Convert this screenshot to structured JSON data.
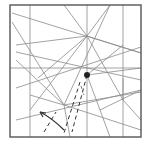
{
  "diagram": {
    "type": "origami-crease-pattern",
    "frame": {
      "x": 10,
      "y": 5,
      "width": 131,
      "height": 132,
      "color": "#555555"
    },
    "crease_color": "#8a8a8a",
    "creases": [
      [
        30,
        5,
        30,
        137
      ],
      [
        123,
        5,
        123,
        137
      ],
      [
        87,
        5,
        87,
        137
      ],
      [
        10,
        68,
        141,
        68
      ],
      [
        12,
        13,
        141,
        53
      ],
      [
        12,
        22,
        64,
        105
      ],
      [
        16,
        45,
        87,
        36
      ],
      [
        16,
        52,
        141,
        80
      ],
      [
        16,
        88,
        141,
        47
      ],
      [
        16,
        120,
        141,
        90
      ],
      [
        64,
        5,
        87,
        36
      ],
      [
        110,
        5,
        87,
        36
      ],
      [
        87,
        36,
        141,
        53
      ],
      [
        87,
        36,
        30,
        110
      ],
      [
        87,
        36,
        123,
        100
      ],
      [
        87,
        36,
        38,
        78
      ],
      [
        64,
        105,
        110,
        5
      ],
      [
        64,
        105,
        141,
        130
      ],
      [
        64,
        105,
        141,
        92
      ],
      [
        64,
        105,
        16,
        60
      ],
      [
        87,
        75,
        141,
        68
      ],
      [
        87,
        75,
        123,
        45
      ],
      [
        87,
        75,
        110,
        137
      ],
      [
        64,
        105,
        70,
        137
      ],
      [
        30,
        95,
        64,
        105
      ],
      [
        123,
        100,
        141,
        120
      ],
      [
        100,
        110,
        141,
        90
      ],
      [
        123,
        78,
        123,
        100
      ]
    ],
    "marked_point": {
      "cx": 87,
      "cy": 75,
      "r": 3,
      "color": "#222222"
    },
    "dashed_lines": [
      [
        80,
        82,
        64,
        133
      ],
      [
        87,
        75,
        72,
        132
      ],
      [
        44,
        132,
        56,
        112
      ]
    ],
    "dash_dot_lines": [
      [
        81,
        86,
        84,
        95
      ]
    ],
    "arrow": {
      "path": "M64 130 Q52 118 40 112",
      "head": "M40 112 L46 113 M40 112 L43 117",
      "direction": "up-left"
    }
  }
}
